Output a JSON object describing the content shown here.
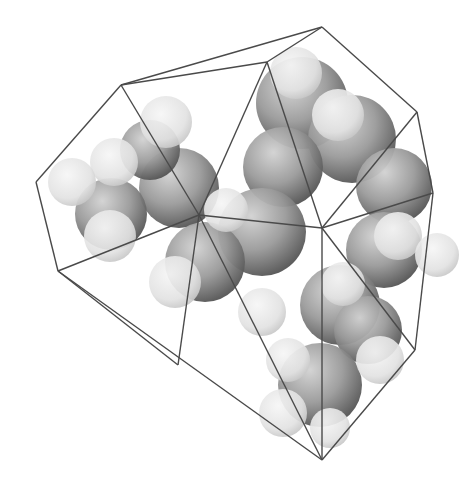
{
  "figure": {
    "background": "#ffffff",
    "edge_color": "#4a4a4a",
    "sphere_dark": "#8c8c8c",
    "sphere_light": "#e6e6e6",
    "vertices": {
      "top": [
        322,
        27
      ],
      "top_inner": [
        267,
        62
      ],
      "upper_left": [
        121,
        85
      ],
      "left": [
        36,
        182
      ],
      "mid_left": [
        58,
        271
      ],
      "center": [
        199,
        215
      ],
      "right_center": [
        322,
        228
      ],
      "upper_right": [
        417,
        112
      ],
      "right": [
        433,
        193
      ],
      "right_lower": [
        415,
        350
      ],
      "bottom": [
        322,
        460
      ],
      "bottom_left": [
        178,
        365
      ]
    },
    "large_spheres": [
      [
        302,
        103,
        46
      ],
      [
        352,
        139,
        44
      ],
      [
        283,
        167,
        40
      ],
      [
        394,
        186,
        38
      ],
      [
        179,
        188,
        40
      ],
      [
        262,
        232,
        44
      ],
      [
        205,
        262,
        40
      ],
      [
        111,
        214,
        36
      ],
      [
        384,
        250,
        38
      ],
      [
        340,
        305,
        40
      ],
      [
        368,
        330,
        34
      ],
      [
        320,
        385,
        42
      ],
      [
        150,
        150,
        30
      ]
    ],
    "small_spheres": [
      [
        296,
        73,
        26
      ],
      [
        338,
        115,
        26
      ],
      [
        166,
        122,
        26
      ],
      [
        114,
        162,
        24
      ],
      [
        72,
        182,
        24
      ],
      [
        110,
        236,
        26
      ],
      [
        175,
        282,
        26
      ],
      [
        262,
        312,
        24
      ],
      [
        226,
        210,
        22
      ],
      [
        398,
        236,
        24
      ],
      [
        437,
        255,
        22
      ],
      [
        380,
        360,
        24
      ],
      [
        343,
        284,
        22
      ],
      [
        288,
        360,
        22
      ],
      [
        283,
        413,
        24
      ],
      [
        330,
        428,
        20
      ]
    ]
  }
}
